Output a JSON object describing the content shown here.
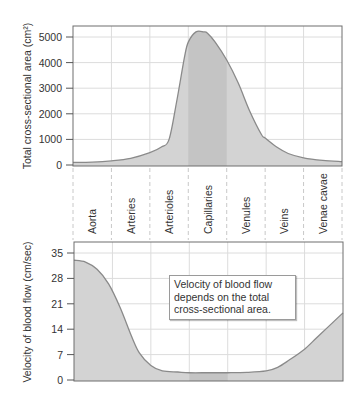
{
  "chart_data": [
    {
      "type": "area",
      "title": "",
      "xlabel": "",
      "ylabel": "Total cross-sectional area (cm²)",
      "ylim": [
        0,
        5300
      ],
      "yticks": [
        0,
        1000,
        2000,
        3000,
        4000,
        5000
      ],
      "grid": true,
      "categories": [
        "Aorta",
        "Arteries",
        "Arterioles",
        "Capillaries",
        "Venules",
        "Veins",
        "Venae cavae"
      ],
      "highlighted_category": "Capillaries",
      "x": [
        0,
        0.5,
        1.0,
        1.5,
        2.0,
        2.3,
        2.5,
        2.7,
        2.9,
        3.0,
        3.2,
        3.4,
        3.5,
        3.7,
        4.0,
        4.3,
        4.6,
        4.9,
        5.0,
        5.3,
        5.6,
        6.0,
        6.5,
        7.0
      ],
      "values": [
        100,
        110,
        160,
        260,
        480,
        700,
        1000,
        2500,
        4200,
        4800,
        5200,
        5200,
        5150,
        4800,
        4100,
        3200,
        2100,
        1200,
        1050,
        700,
        450,
        280,
        180,
        130
      ],
      "fill_colors": {
        "area": "#d3d3d3",
        "highlight": "#c4c4c4",
        "line": "#8a8a8a"
      }
    },
    {
      "type": "area",
      "title": "",
      "xlabel": "",
      "ylabel": "Velocity of blood flow (cm/sec)",
      "ylim": [
        0,
        37
      ],
      "yticks": [
        0,
        7,
        14,
        21,
        28,
        35
      ],
      "grid": true,
      "categories": [
        "Aorta",
        "Arteries",
        "Arterioles",
        "Capillaries",
        "Venules",
        "Veins",
        "Venae cavae"
      ],
      "highlighted_category": "Capillaries",
      "x": [
        0,
        0.3,
        0.6,
        0.9,
        1.2,
        1.5,
        1.7,
        2.0,
        2.3,
        2.7,
        3.0,
        3.5,
        4.0,
        4.5,
        5.0,
        5.3,
        5.6,
        6.0,
        6.3,
        6.6,
        7.0
      ],
      "values": [
        33,
        32.5,
        30.5,
        26.5,
        20,
        12,
        7.5,
        4,
        2.5,
        2.2,
        2.0,
        2.0,
        2.0,
        2.1,
        2.5,
        3.5,
        5.5,
        8.5,
        11.5,
        14.5,
        18.5
      ],
      "annotation": [
        "Velocity of blood flow",
        "depends on the total",
        "cross-sectional area."
      ],
      "fill_colors": {
        "area": "#d3d3d3",
        "highlight": "#c4c4c4",
        "line": "#8a8a8a"
      }
    }
  ]
}
